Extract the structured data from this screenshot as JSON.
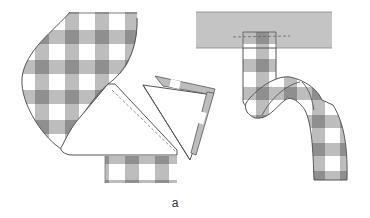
{
  "figure": {
    "caption": "a",
    "colors": {
      "gingham_dark": "#8f8f8f",
      "gingham_mid": "#b9b9b9",
      "gingham_light": "#ffffff",
      "band": "#c4c4c4",
      "outline": "#555555",
      "stitch": "#777777"
    },
    "panels": [
      {
        "name": "left-fold",
        "label": "Ribbon folded diagonally with stitching line"
      },
      {
        "name": "triangle-detail",
        "label": "Folded triangle point detail"
      },
      {
        "name": "right-band",
        "label": "Ribbon stitched to band and twisted"
      }
    ]
  }
}
